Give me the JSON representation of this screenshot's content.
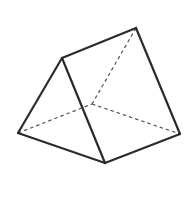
{
  "diagram": {
    "colors": {
      "background": "#ffffff",
      "edge": "#2b2b2b",
      "hidden_edge": "#555555"
    },
    "vertices": {
      "A": [
        62,
        58
      ],
      "B": [
        136,
        28
      ],
      "C": [
        18,
        133
      ],
      "D": [
        105,
        163
      ],
      "E": [
        180,
        134
      ],
      "F": [
        92,
        104
      ]
    },
    "visible_edges": [
      [
        "A",
        "B"
      ],
      [
        "A",
        "C"
      ],
      [
        "A",
        "D"
      ],
      [
        "C",
        "D"
      ],
      [
        "D",
        "E"
      ],
      [
        "B",
        "E"
      ]
    ],
    "hidden_edges": [
      [
        "B",
        "F"
      ],
      [
        "C",
        "F"
      ],
      [
        "F",
        "E"
      ]
    ]
  }
}
